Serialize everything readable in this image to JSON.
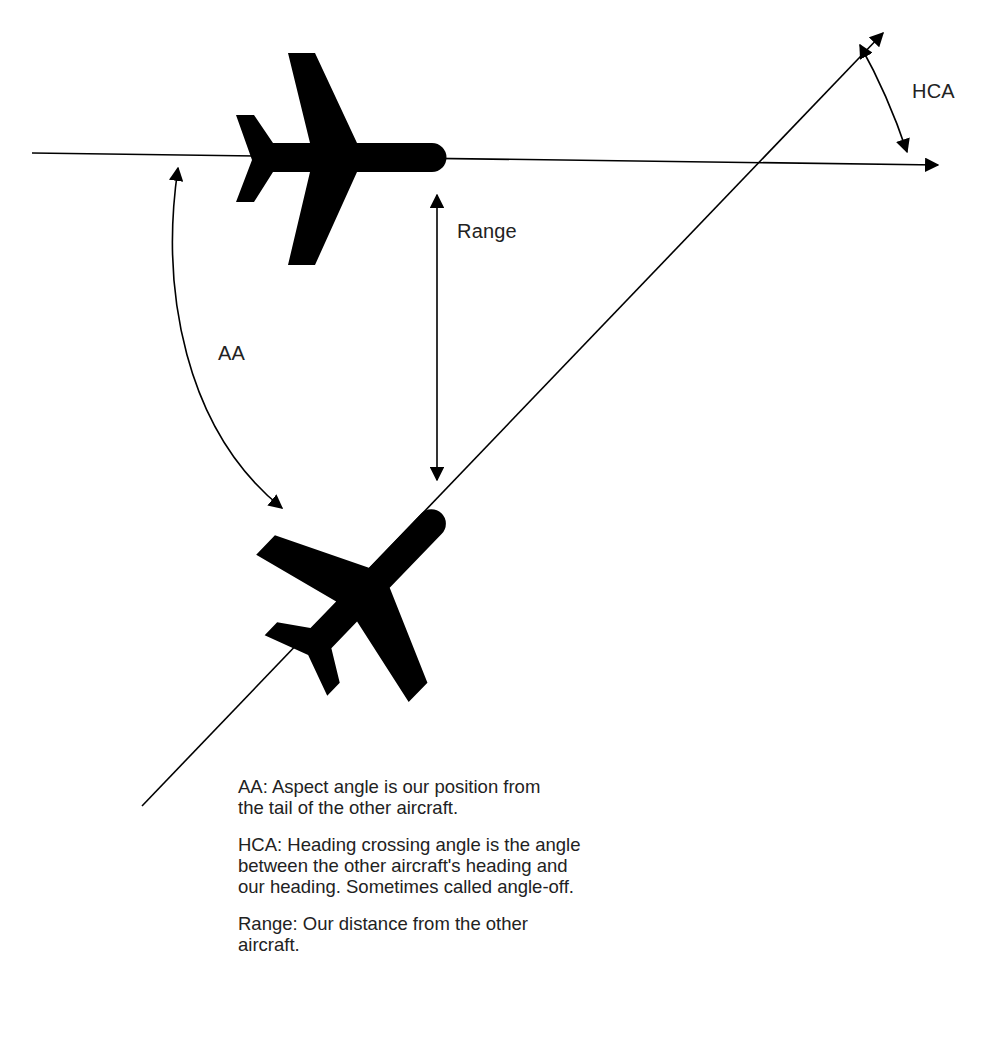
{
  "labels": {
    "hca": "HCA",
    "range": "Range",
    "aa": "AA"
  },
  "legend": {
    "aa": "AA: Aspect angle is our position from the tail of the other aircraft.",
    "hca": "HCA: Heading crossing angle is the angle between the other aircraft's heading and our heading. Sometimes called angle-off.",
    "range": "Range: Our distance from the other aircraft."
  },
  "icons": {
    "top_aircraft": "airplane-silhouette-icon",
    "bottom_aircraft": "airplane-silhouette-icon"
  },
  "colors": {
    "ink": "#000000",
    "background": "#ffffff"
  }
}
